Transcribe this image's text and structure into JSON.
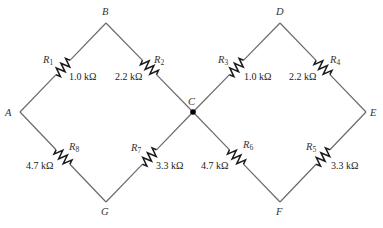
{
  "nodes": [
    {
      "id": "A",
      "label": "A"
    },
    {
      "id": "B",
      "label": "B"
    },
    {
      "id": "C",
      "label": "C"
    },
    {
      "id": "D",
      "label": "D"
    },
    {
      "id": "E",
      "label": "E"
    },
    {
      "id": "F",
      "label": "F"
    },
    {
      "id": "G",
      "label": "G"
    }
  ],
  "resistors": [
    {
      "name": "R",
      "sub": "1",
      "value": "1.0 kΩ",
      "from": "A",
      "to": "B"
    },
    {
      "name": "R",
      "sub": "2",
      "value": "2.2 kΩ",
      "from": "B",
      "to": "C"
    },
    {
      "name": "R",
      "sub": "3",
      "value": "1.0 kΩ",
      "from": "C",
      "to": "D"
    },
    {
      "name": "R",
      "sub": "4",
      "value": "2.2 kΩ",
      "from": "D",
      "to": "E"
    },
    {
      "name": "R",
      "sub": "5",
      "value": "3.3 kΩ",
      "from": "E",
      "to": "F"
    },
    {
      "name": "R",
      "sub": "6",
      "value": "4.7 kΩ",
      "from": "F",
      "to": "C"
    },
    {
      "name": "R",
      "sub": "7",
      "value": "3.3 kΩ",
      "from": "C",
      "to": "G"
    },
    {
      "name": "R",
      "sub": "8",
      "value": "4.7 kΩ",
      "from": "G",
      "to": "A"
    }
  ],
  "junction": "C"
}
